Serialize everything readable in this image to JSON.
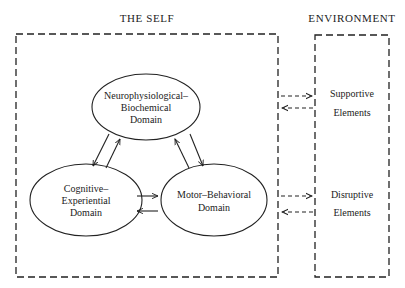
{
  "diagram": {
    "sections": {
      "self": {
        "title": "THE SELF"
      },
      "environment": {
        "title": "ENVIRONMENT"
      }
    },
    "nodes": [
      {
        "id": "neuro",
        "lines": [
          "Neurophysiological–",
          "Biochemical",
          "Domain"
        ]
      },
      {
        "id": "cognitive",
        "lines": [
          "Cognitive–",
          "Experiential",
          "Domain"
        ]
      },
      {
        "id": "motor",
        "lines": [
          "Motor–Behavioral",
          "Domain"
        ]
      }
    ],
    "environment_elements": [
      {
        "id": "supportive",
        "lines": [
          "Supportive",
          "Elements"
        ]
      },
      {
        "id": "disruptive",
        "lines": [
          "Disruptive",
          "Elements"
        ]
      }
    ],
    "edges": [
      {
        "from": "neuro",
        "to": "cognitive",
        "style": "solid"
      },
      {
        "from": "cognitive",
        "to": "neuro",
        "style": "solid"
      },
      {
        "from": "neuro",
        "to": "motor",
        "style": "solid"
      },
      {
        "from": "motor",
        "to": "neuro",
        "style": "solid"
      },
      {
        "from": "cognitive",
        "to": "motor",
        "style": "solid"
      },
      {
        "from": "motor",
        "to": "cognitive",
        "style": "solid"
      },
      {
        "from": "self",
        "to": "supportive",
        "style": "dashed"
      },
      {
        "from": "supportive",
        "to": "self",
        "style": "dashed"
      },
      {
        "from": "self",
        "to": "disruptive",
        "style": "dashed"
      },
      {
        "from": "disruptive",
        "to": "self",
        "style": "dashed"
      }
    ]
  }
}
